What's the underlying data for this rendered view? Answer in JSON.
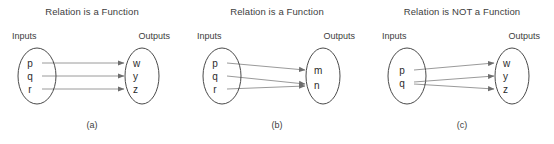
{
  "figure": {
    "background_color": "#ffffff",
    "line_color": "#9a9a9a",
    "ellipse_color": "#4a4a4a",
    "text_color": "#3d3d3d"
  },
  "panels": [
    {
      "title": "Relation is a Function",
      "inputs_label": "Inputs",
      "outputs_label": "Outputs",
      "caption": "(a)",
      "inputs": [
        "p",
        "q",
        "r"
      ],
      "outputs": [
        "w",
        "y",
        "z"
      ],
      "mappings": [
        {
          "from": "p",
          "to": "w"
        },
        {
          "from": "q",
          "to": "y"
        },
        {
          "from": "r",
          "to": "z"
        }
      ]
    },
    {
      "title": "Relation is a Function",
      "inputs_label": "Inputs",
      "outputs_label": "Outputs",
      "caption": "(b)",
      "inputs": [
        "p",
        "q",
        "r"
      ],
      "outputs": [
        "m",
        "n"
      ],
      "mappings": [
        {
          "from": "p",
          "to": "m"
        },
        {
          "from": "q",
          "to": "n"
        },
        {
          "from": "r",
          "to": "n"
        }
      ]
    },
    {
      "title": "Relation is NOT a Function",
      "inputs_label": "Inputs",
      "outputs_label": "Outputs",
      "caption": "(c)",
      "inputs": [
        "p",
        "q"
      ],
      "outputs": [
        "w",
        "y",
        "z"
      ],
      "mappings": [
        {
          "from": "p",
          "to": "w"
        },
        {
          "from": "q",
          "to": "y"
        },
        {
          "from": "q",
          "to": "z"
        }
      ]
    }
  ]
}
